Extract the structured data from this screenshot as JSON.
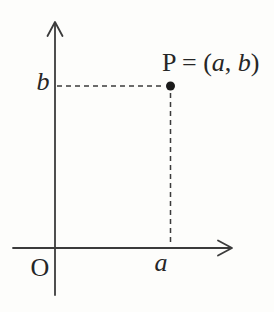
{
  "figure": {
    "colors": {
      "background": "#fdfdfb",
      "line": "#3b3b3b",
      "text": "#262626",
      "point": "#1a1a1a"
    },
    "point_label": {
      "prefix": "P = (",
      "x_var": "a",
      "separator": ", ",
      "y_var": "b",
      "suffix": ")"
    },
    "axis_labels": {
      "origin": "O",
      "x_value": "a",
      "y_value": "b"
    }
  }
}
